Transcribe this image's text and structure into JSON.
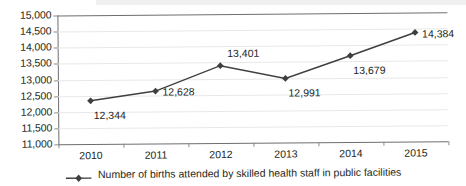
{
  "chart_data": {
    "type": "line",
    "title": "",
    "subtitle": "",
    "xlabel": "",
    "ylabel": "",
    "categories": [
      "2010",
      "2011",
      "2012",
      "2013",
      "2014",
      "2015"
    ],
    "series": [
      {
        "name": "Number of births attended by skilled health staff in public facilities",
        "values": [
          12344,
          12628,
          13401,
          12991,
          13679,
          14384
        ],
        "color": "#3f3f42",
        "marker": "diamond"
      }
    ],
    "data_labels": [
      "12,344",
      "12,628",
      "13,401",
      "12,991",
      "13,679",
      "14,384"
    ],
    "data_label_positions": [
      "below-right",
      "right",
      "above-right",
      "below-right",
      "below-right",
      "right"
    ],
    "ylim": [
      11000,
      15000
    ],
    "ytick_values": [
      15000,
      14500,
      14000,
      13500,
      13000,
      12500,
      12000,
      11500,
      11000
    ],
    "ytick_labels": [
      "15,000",
      "14,500",
      "14,000",
      "13,500",
      "13,000",
      "12,500",
      "12,000",
      "11,500",
      "11,000"
    ],
    "grid": true,
    "grid_color": "#e8e8ea",
    "axis_color": "#6d6e71",
    "legend_position": "bottom",
    "legend_entries": [
      "Number of births attended by skilled health staff in public facilities"
    ]
  },
  "legend": {
    "label": "Number of births attended by skilled health staff in public facilities"
  }
}
